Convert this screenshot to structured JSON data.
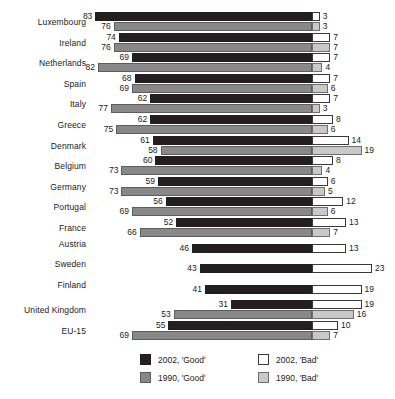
{
  "chart_data": {
    "type": "bar",
    "title": "",
    "subtitle": "",
    "xlabel": "",
    "ylabel": "",
    "orientation": "horizontal",
    "layout": "diverging-stacked",
    "grid": false,
    "legend_position": "bottom",
    "axis_origin_note": "'Good' bars extend leftward from a shared centre line; 'Bad' bars extend rightward from the same line",
    "categories": [
      "Luxembourg",
      "Ireland",
      "Netherlands",
      "Spain",
      "Italy",
      "Greece",
      "Denmark",
      "Belgium",
      "Germany",
      "Portugal",
      "France",
      "Austria",
      "Sweden",
      "Finland",
      "United Kingdom",
      "EU-15"
    ],
    "series": [
      {
        "name": "2002, 'Good'",
        "color": "#231f20",
        "side": "left",
        "values": [
          83,
          74,
          69,
          68,
          62,
          62,
          61,
          60,
          59,
          56,
          52,
          46,
          43,
          41,
          31,
          55
        ]
      },
      {
        "name": "2002, 'Bad'",
        "color": "#ffffff",
        "side": "right",
        "values": [
          3,
          7,
          7,
          7,
          7,
          8,
          14,
          8,
          6,
          12,
          13,
          13,
          23,
          19,
          19,
          10
        ]
      },
      {
        "name": "1990, 'Good'",
        "color": "#888888",
        "side": "left",
        "values": [
          76,
          76,
          82,
          69,
          77,
          75,
          58,
          73,
          73,
          69,
          66,
          null,
          null,
          null,
          53,
          69
        ]
      },
      {
        "name": "1990, 'Bad'",
        "color": "#c9c9c9",
        "side": "right",
        "values": [
          3,
          7,
          4,
          6,
          3,
          6,
          19,
          4,
          5,
          6,
          7,
          null,
          null,
          null,
          16,
          7
        ]
      }
    ],
    "rows": [
      {
        "label": "Luxembourg",
        "good2002": 83,
        "bad2002": 3,
        "good1990": 76,
        "bad1990": 3
      },
      {
        "label": "Ireland",
        "good2002": 74,
        "bad2002": 7,
        "good1990": 76,
        "bad1990": 7
      },
      {
        "label": "Netherlands",
        "good2002": 69,
        "bad2002": 7,
        "good1990": 82,
        "bad1990": 4
      },
      {
        "label": "Spain",
        "good2002": 68,
        "bad2002": 7,
        "good1990": 69,
        "bad1990": 6
      },
      {
        "label": "Italy",
        "good2002": 62,
        "bad2002": 7,
        "good1990": 77,
        "bad1990": 3
      },
      {
        "label": "Greece",
        "good2002": 62,
        "bad2002": 8,
        "good1990": 75,
        "bad1990": 6
      },
      {
        "label": "Denmark",
        "good2002": 61,
        "bad2002": 14,
        "good1990": 58,
        "bad1990": 19
      },
      {
        "label": "Belgium",
        "good2002": 60,
        "bad2002": 8,
        "good1990": 73,
        "bad1990": 4
      },
      {
        "label": "Germany",
        "good2002": 59,
        "bad2002": 6,
        "good1990": 73,
        "bad1990": 5
      },
      {
        "label": "Portugal",
        "good2002": 56,
        "bad2002": 12,
        "good1990": 69,
        "bad1990": 6
      },
      {
        "label": "France",
        "good2002": 52,
        "bad2002": 13,
        "good1990": 66,
        "bad1990": 7
      },
      {
        "label": "Austria",
        "good2002": 46,
        "bad2002": 13,
        "good1990": null,
        "bad1990": null
      },
      {
        "label": "Sweden",
        "good2002": 43,
        "bad2002": 23,
        "good1990": null,
        "bad1990": null
      },
      {
        "label": "Finland",
        "good2002": 41,
        "bad2002": 19,
        "good1990": null,
        "bad1990": null
      },
      {
        "label": "United Kingdom",
        "good2002": 31,
        "bad2002": 19,
        "good1990": 53,
        "bad1990": 16
      },
      {
        "label": "EU-15",
        "good2002": 55,
        "bad2002": 10,
        "good1990": 69,
        "bad1990": 7
      }
    ]
  },
  "legend": {
    "entries": [
      {
        "label": "2002, 'Good'",
        "swatch": "good2002",
        "color": "#231f20"
      },
      {
        "label": "2002, 'Bad'",
        "swatch": "bad2002",
        "color": "#ffffff"
      },
      {
        "label": "1990, 'Good'",
        "swatch": "good1990",
        "color": "#888888"
      },
      {
        "label": "1990, 'Bad'",
        "swatch": "bad1990",
        "color": "#c9c9c9"
      }
    ]
  }
}
